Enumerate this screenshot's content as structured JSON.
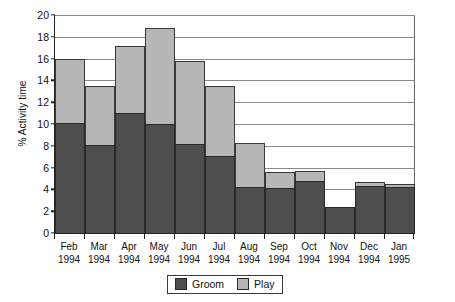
{
  "chart_data": {
    "type": "bar",
    "subtype": "stacked-vertical",
    "title": "",
    "xlabel": "",
    "ylabel": "% Activity time",
    "ylim": [
      0,
      20
    ],
    "ytick_step": 2,
    "yticks": [
      0,
      2,
      4,
      6,
      8,
      10,
      12,
      14,
      16,
      18,
      20
    ],
    "ytick_labels": [
      "0",
      "2",
      "4",
      "6",
      "8",
      "10",
      "12",
      "14",
      "16",
      "18",
      "20"
    ],
    "grid": true,
    "grid_axis": "y",
    "legend_position": "bottom-center",
    "categories": [
      "Feb 1994",
      "Mar 1994",
      "Apr 1994",
      "May 1994",
      "Jun 1994",
      "Jul 1994",
      "Aug 1994",
      "Sep 1994",
      "Oct 1994",
      "Nov 1994",
      "Dec 1994",
      "Jan 1995"
    ],
    "category_lines": [
      [
        "Feb",
        "1994"
      ],
      [
        "Mar",
        "1994"
      ],
      [
        "Apr",
        "1994"
      ],
      [
        "May",
        "1994"
      ],
      [
        "Jun",
        "1994"
      ],
      [
        "Jul",
        "1994"
      ],
      [
        "Aug",
        "1994"
      ],
      [
        "Sep",
        "1994"
      ],
      [
        "Oct",
        "1994"
      ],
      [
        "Nov",
        "1994"
      ],
      [
        "Dec",
        "1994"
      ],
      [
        "Jan",
        "1995"
      ]
    ],
    "series": [
      {
        "name": "Groom",
        "color": "#4e4e4e",
        "values": [
          10.1,
          8.1,
          11.0,
          10.0,
          8.2,
          7.1,
          4.2,
          4.1,
          4.8,
          2.4,
          4.3,
          4.2
        ]
      },
      {
        "name": "Play",
        "color": "#b6b6b6",
        "values": [
          5.9,
          5.4,
          6.2,
          8.8,
          7.6,
          6.4,
          4.1,
          1.5,
          0.9,
          0.0,
          0.4,
          0.3
        ]
      }
    ],
    "stack_totals": [
      16.0,
      13.5,
      17.2,
      18.8,
      15.8,
      13.5,
      8.3,
      5.6,
      5.7,
      2.4,
      4.7,
      4.5
    ]
  },
  "legend": {
    "entries": [
      {
        "label": "Groom",
        "color": "#4e4e4e"
      },
      {
        "label": "Play",
        "color": "#b6b6b6"
      }
    ]
  },
  "colors": {
    "groom": "#4e4e4e",
    "play": "#b6b6b6",
    "axis": "#222222",
    "grid": "#8a8a8a",
    "background": "#ffffff"
  }
}
